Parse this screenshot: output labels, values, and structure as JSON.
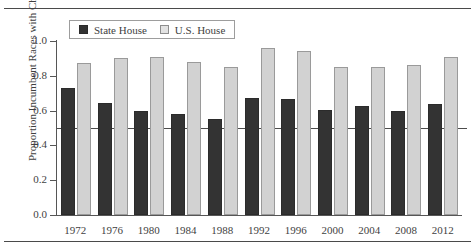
{
  "chart_data": {
    "type": "bar",
    "title": "",
    "xlabel": "",
    "ylabel": "Proportion Incumbent Races with Challenger",
    "ylim": [
      0.0,
      1.0
    ],
    "yticks": [
      "1.0",
      "0.8",
      "0.6",
      "0.4",
      "0.2",
      "0.0"
    ],
    "ytick_values": [
      1.0,
      0.8,
      0.6,
      0.4,
      0.2,
      0.0
    ],
    "grid": false,
    "legend_position": "top-left",
    "categories": [
      "1972",
      "1976",
      "1980",
      "1984",
      "1988",
      "1992",
      "1996",
      "2000",
      "2004",
      "2008",
      "2012"
    ],
    "series": [
      {
        "name": "State House",
        "color": "#333333",
        "values": [
          0.73,
          0.645,
          0.6,
          0.58,
          0.55,
          0.675,
          0.665,
          0.605,
          0.625,
          0.6,
          0.64
        ]
      },
      {
        "name": "U.S. House",
        "color": "#d2d2d2",
        "values": [
          0.875,
          0.905,
          0.91,
          0.88,
          0.85,
          0.96,
          0.945,
          0.85,
          0.85,
          0.865,
          0.91
        ]
      }
    ],
    "reference_line": {
      "name": "fifty-percent-line",
      "value": 0.5,
      "color": "#4c4c4c"
    }
  },
  "legend": {
    "items": [
      {
        "label": "State House",
        "swatch": "dark-square-swatch"
      },
      {
        "label": "U.S. House",
        "swatch": "light-square-swatch"
      }
    ]
  }
}
